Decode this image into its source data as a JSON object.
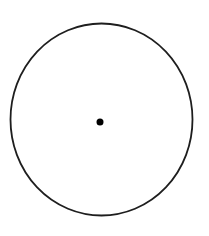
{
  "diagram": {
    "background": "#ffffff",
    "circle": {
      "cx": 101.5,
      "cy": 119.5,
      "rx": 91,
      "ry": 96,
      "stroke": "#1e1e1e",
      "stroke_width": 1.8,
      "fill": "none"
    },
    "center_point": {
      "cx": 100,
      "cy": 122,
      "r": 3.5,
      "fill": "#000000"
    }
  }
}
